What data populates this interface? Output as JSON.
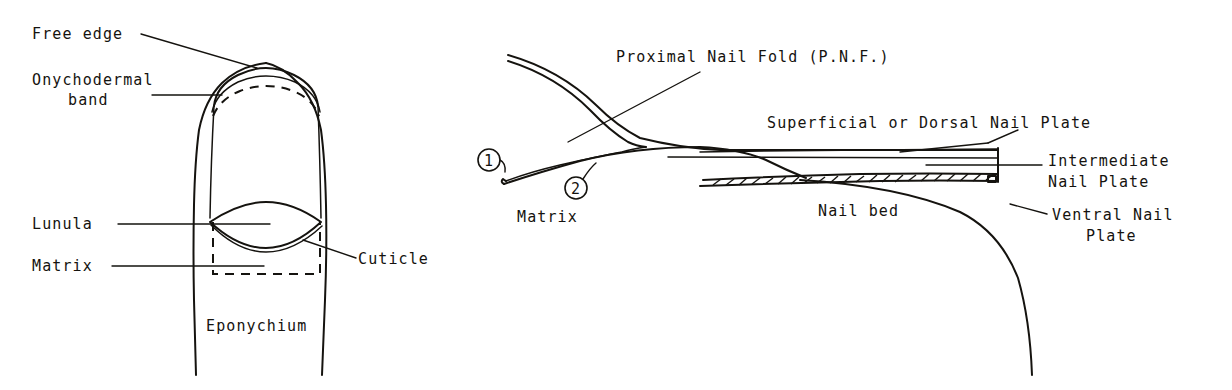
{
  "figure": {
    "background_color": "#ffffff",
    "ink_color": "#15130f"
  },
  "left_diagram": {
    "name": "dorsal-view-of-fingernail",
    "labels": {
      "free_edge": "Free edge",
      "onychodermal_band_line1": "Onychodermal",
      "onychodermal_band_line2": "band",
      "lunula": "Lunula",
      "matrix": "Matrix",
      "cuticle": "Cuticle",
      "eponychium": "Eponychium"
    }
  },
  "right_diagram": {
    "name": "sagittal-section-of-nail-unit",
    "labels": {
      "proximal_nail_fold": "Proximal Nail Fold (P.N.F.)",
      "superficial_dorsal_nail_plate": "Superficial or Dorsal Nail Plate",
      "intermediate_nail_plate_line1": "Intermediate",
      "intermediate_nail_plate_line2": "Nail Plate",
      "ventral_nail_plate_line1": "Ventral Nail",
      "ventral_nail_plate_line2": "Plate",
      "nail_bed": "Nail bed",
      "matrix": "Matrix"
    },
    "callouts": {
      "marker_one": "1",
      "marker_two": "2"
    }
  }
}
